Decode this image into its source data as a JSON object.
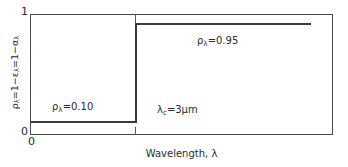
{
  "figure": {
    "kind": "step-plot",
    "background_color": "#ffffff",
    "line_color": "#3a3a3a",
    "frame_color": "#4a4a4a"
  },
  "axes": {
    "y": {
      "title_parts": {
        "rho": "ρ",
        "lam1": "λ",
        "eq1": "=1−",
        "eps": "ε",
        "lam2": "λ",
        "eq2": "=1−",
        "alpha": "α",
        "lam3": "λ"
      },
      "title_plain": "ρλ=1−ελ=1−αλ",
      "tick_top": "1",
      "tick_bottom": "0",
      "range": [
        0,
        1
      ]
    },
    "x": {
      "title_text": "Wavelength, ",
      "title_symbol": "λ",
      "tick_origin": "0"
    }
  },
  "annotations": {
    "low_plateau": {
      "symbol": "ρ",
      "subscript": "λ",
      "value_text": "=0.10"
    },
    "high_plateau": {
      "symbol": "ρ",
      "subscript": "λ",
      "value_text": "=0.95"
    },
    "cutoff": {
      "symbol": "λ",
      "subscript": "c",
      "value_text": "=3μm"
    }
  },
  "chart_data": {
    "type": "line",
    "title": "",
    "xlabel": "Wavelength, λ",
    "ylabel": "ρλ = 1 − ελ = 1 − αλ",
    "ylim": [
      0,
      1
    ],
    "yticks": [
      0,
      1
    ],
    "yticklabels": [
      "0",
      "1"
    ],
    "xticks": [
      0
    ],
    "xticklabels": [
      "0"
    ],
    "grid": false,
    "legend": null,
    "series": [
      {
        "name": "Spectral reflectivity",
        "step": "post",
        "x": [
          0.0,
          3.0,
          3.0,
          9.3
        ],
        "y": [
          0.1,
          0.1,
          0.95,
          0.95
        ]
      }
    ],
    "step_points": {
      "low_value": 0.1,
      "high_value": 0.95,
      "cutoff_wavelength_um": 3
    },
    "annotations": [
      {
        "text": "ρλ=0.10",
        "x": 1.2,
        "y": 0.28
      },
      {
        "text": "ρλ=0.95",
        "x": 5.3,
        "y": 0.82
      },
      {
        "text": "λc=3μm",
        "x": 3.9,
        "y": 0.26
      }
    ]
  }
}
